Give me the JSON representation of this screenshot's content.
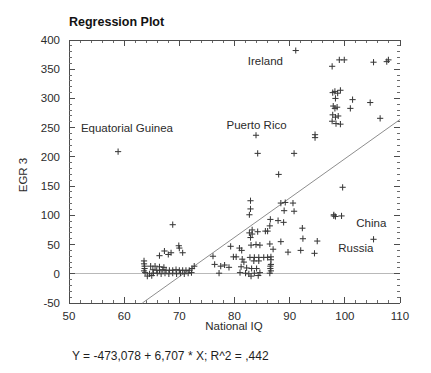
{
  "chart_data": {
    "type": "scatter",
    "title": "Regression Plot",
    "xlabel": "National IQ",
    "ylabel": "EGR 3",
    "xlim": [
      50,
      110
    ],
    "ylim": [
      -50,
      400
    ],
    "xticks": [
      50,
      60,
      70,
      80,
      90,
      100,
      110
    ],
    "yticks": [
      -50,
      0,
      50,
      100,
      150,
      200,
      250,
      300,
      350,
      400
    ],
    "xtick_labels": [
      "50",
      "60",
      "70",
      "80",
      "90",
      "100",
      "110"
    ],
    "ytick_labels": [
      "-50",
      "0",
      "50",
      "100",
      "150",
      "200",
      "250",
      "300",
      "350",
      "400"
    ],
    "grid": false,
    "legend": "none",
    "minor_ticks_per_major_x": 5,
    "minor_ticks_per_major_y": 5,
    "zero_reference_line": 0,
    "equation": "Y = -473,078 + 6,707 * X; R^2 = ,442",
    "fit": {
      "intercept": -473.078,
      "slope": 6.707,
      "r_squared": 0.442,
      "x_start": 63.3,
      "x_end": 110.0,
      "y_start": -50,
      "y_end": 264
    },
    "annotations": [
      {
        "text": "Ireland",
        "x": 85.6,
        "y": 358
      },
      {
        "text": "Equatorial Guinea",
        "x": 60.5,
        "y": 243
      },
      {
        "text": "Puerto Rico",
        "x": 84.0,
        "y": 247
      },
      {
        "text": "China",
        "x": 104.8,
        "y": 80
      },
      {
        "text": "Russia",
        "x": 102.0,
        "y": 37
      }
    ],
    "marker_style": "plus",
    "points": [
      [
        58.9,
        209
      ],
      [
        91.1,
        382
      ],
      [
        97.7,
        355
      ],
      [
        99.9,
        366
      ],
      [
        99.0,
        366
      ],
      [
        105.2,
        362
      ],
      [
        107.6,
        363
      ],
      [
        107.9,
        366
      ],
      [
        97.8,
        310
      ],
      [
        98.2,
        312
      ],
      [
        98.7,
        309
      ],
      [
        99.2,
        314
      ],
      [
        98.3,
        300
      ],
      [
        101.4,
        298
      ],
      [
        97.9,
        287
      ],
      [
        98.2,
        283
      ],
      [
        98.6,
        285
      ],
      [
        101.0,
        283
      ],
      [
        104.6,
        293
      ],
      [
        97.8,
        272
      ],
      [
        98.3,
        268
      ],
      [
        98.8,
        270
      ],
      [
        106.4,
        266
      ],
      [
        97.7,
        261
      ],
      [
        98.4,
        257
      ],
      [
        99.2,
        256
      ],
      [
        94.6,
        238
      ],
      [
        94.6,
        233
      ],
      [
        83.9,
        237
      ],
      [
        84.2,
        206
      ],
      [
        90.8,
        206
      ],
      [
        88.0,
        170
      ],
      [
        99.6,
        148
      ],
      [
        82.9,
        125
      ],
      [
        82.9,
        111
      ],
      [
        82.7,
        101
      ],
      [
        88.4,
        121
      ],
      [
        89.2,
        122
      ],
      [
        90.6,
        121
      ],
      [
        89.0,
        108
      ],
      [
        90.8,
        107
      ],
      [
        98.0,
        101
      ],
      [
        98.0,
        99
      ],
      [
        98.3,
        98
      ],
      [
        99.4,
        99
      ],
      [
        86.5,
        93
      ],
      [
        87.9,
        91
      ],
      [
        88.9,
        88
      ],
      [
        86.4,
        82
      ],
      [
        68.8,
        84
      ],
      [
        92.3,
        78
      ],
      [
        83.2,
        75
      ],
      [
        84.2,
        72
      ],
      [
        85.6,
        73
      ],
      [
        86.0,
        73
      ],
      [
        82.7,
        70
      ],
      [
        83.2,
        68
      ],
      [
        82.9,
        62
      ],
      [
        92.4,
        60
      ],
      [
        105.2,
        59
      ],
      [
        88.4,
        55
      ],
      [
        95.0,
        56
      ],
      [
        83.0,
        49
      ],
      [
        83.9,
        50
      ],
      [
        84.6,
        49
      ],
      [
        86.4,
        51
      ],
      [
        69.9,
        48
      ],
      [
        70.0,
        44
      ],
      [
        67.3,
        39
      ],
      [
        68.5,
        36
      ],
      [
        70.6,
        36
      ],
      [
        66.4,
        31
      ],
      [
        68.0,
        33
      ],
      [
        79.3,
        47
      ],
      [
        80.9,
        44
      ],
      [
        81.3,
        40
      ],
      [
        87.0,
        42
      ],
      [
        89.7,
        37
      ],
      [
        92.0,
        40
      ],
      [
        94.5,
        35
      ],
      [
        76.1,
        30
      ],
      [
        79.8,
        29
      ],
      [
        80.3,
        29
      ],
      [
        81.4,
        25
      ],
      [
        82.8,
        28
      ],
      [
        83.6,
        28
      ],
      [
        84.4,
        28
      ],
      [
        85.3,
        28
      ],
      [
        86.0,
        28
      ],
      [
        86.6,
        29
      ],
      [
        86.6,
        24
      ],
      [
        83.5,
        22
      ],
      [
        84.4,
        22
      ],
      [
        81.7,
        20
      ],
      [
        63.6,
        22
      ],
      [
        63.6,
        17
      ],
      [
        63.7,
        13
      ],
      [
        63.7,
        9
      ],
      [
        63.6,
        5
      ],
      [
        64.8,
        13
      ],
      [
        65.6,
        13
      ],
      [
        66.4,
        12
      ],
      [
        67.2,
        11
      ],
      [
        76.4,
        16
      ],
      [
        77.5,
        13
      ],
      [
        78.2,
        15
      ],
      [
        79.0,
        11
      ],
      [
        65.2,
        7
      ],
      [
        65.9,
        6
      ],
      [
        66.4,
        6
      ],
      [
        67.0,
        7
      ],
      [
        67.6,
        6
      ],
      [
        68.2,
        6
      ],
      [
        68.8,
        6
      ],
      [
        69.4,
        7
      ],
      [
        70.0,
        6
      ],
      [
        70.6,
        6
      ],
      [
        71.2,
        6
      ],
      [
        71.8,
        6
      ],
      [
        72.3,
        9
      ],
      [
        72.7,
        13
      ],
      [
        81.2,
        12
      ],
      [
        82.2,
        10
      ],
      [
        83.1,
        9
      ],
      [
        84.0,
        9
      ],
      [
        86.5,
        9
      ],
      [
        86.5,
        13
      ],
      [
        86.6,
        16
      ],
      [
        86.6,
        5
      ],
      [
        63.8,
        2
      ],
      [
        64.6,
        0
      ],
      [
        65.3,
        1
      ],
      [
        66.0,
        1
      ],
      [
        66.7,
        0
      ],
      [
        67.4,
        1
      ],
      [
        68.1,
        0
      ],
      [
        68.8,
        1
      ],
      [
        69.5,
        0
      ],
      [
        70.2,
        1
      ],
      [
        70.9,
        0
      ],
      [
        71.6,
        1
      ],
      [
        72.2,
        2
      ],
      [
        81.0,
        2
      ],
      [
        82.0,
        1
      ],
      [
        82.6,
        0
      ],
      [
        83.6,
        1
      ],
      [
        84.6,
        2
      ],
      [
        86.4,
        1
      ],
      [
        77.2,
        1
      ],
      [
        64.2,
        -4
      ],
      [
        65.0,
        -3
      ],
      [
        83.0,
        -4
      ],
      [
        84.3,
        -3
      ]
    ]
  }
}
